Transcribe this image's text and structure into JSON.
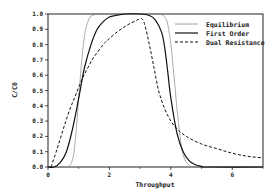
{
  "chart_data": {
    "type": "line",
    "title": "",
    "xlabel": "Throughput",
    "ylabel": "C/C0",
    "xlim": [
      0,
      7
    ],
    "ylim": [
      0,
      1.0
    ],
    "xticks": [
      0,
      2,
      4,
      6
    ],
    "xminor_ticks": [
      1,
      3,
      5,
      7
    ],
    "yticks": [
      0.0,
      0.1,
      0.2,
      0.3,
      0.4,
      0.5,
      0.6,
      0.7,
      0.8,
      0.9,
      1.0
    ],
    "ytick_labels": [
      "0.0",
      "0.1",
      "0.2",
      "0.3",
      "0.4",
      "0.5",
      "0.6",
      "0.7",
      "0.8",
      "0.9",
      "1.0"
    ],
    "grid": false,
    "legend_position": "upper right",
    "series": [
      {
        "name": "Equilibrium",
        "style": "thin-solid",
        "color": "#888888",
        "x": [
          0,
          0.6,
          0.8,
          0.9,
          1.0,
          1.1,
          1.2,
          1.3,
          1.4,
          1.6,
          1.8,
          2.0,
          3.0,
          3.6,
          3.8,
          3.9,
          4.0,
          4.1,
          4.2,
          4.3,
          4.4,
          4.6,
          5.0,
          7.0
        ],
        "y": [
          0,
          0,
          0.05,
          0.2,
          0.45,
          0.7,
          0.87,
          0.95,
          0.985,
          1.0,
          1.0,
          1.0,
          1.0,
          1.0,
          0.98,
          0.93,
          0.8,
          0.6,
          0.38,
          0.2,
          0.08,
          0.01,
          0,
          0
        ]
      },
      {
        "name": "First Order",
        "style": "solid",
        "color": "#111111",
        "x": [
          0,
          0.2,
          0.4,
          0.6,
          0.8,
          1.0,
          1.1,
          1.2,
          1.4,
          1.6,
          1.8,
          2.0,
          2.2,
          2.5,
          3.0,
          3.3,
          3.5,
          3.7,
          3.8,
          3.9,
          4.0,
          4.2,
          4.4,
          4.6,
          4.8,
          5.0,
          5.2,
          7.0
        ],
        "y": [
          0,
          0.0,
          0.03,
          0.1,
          0.25,
          0.45,
          0.56,
          0.66,
          0.8,
          0.9,
          0.95,
          0.98,
          0.99,
          1.0,
          1.0,
          0.99,
          0.96,
          0.88,
          0.78,
          0.62,
          0.45,
          0.22,
          0.1,
          0.04,
          0.015,
          0.005,
          0,
          0
        ]
      },
      {
        "name": "Dual Resistance",
        "style": "dashed",
        "color": "#111111",
        "x": [
          0.1,
          0.3,
          0.5,
          0.7,
          0.9,
          1.1,
          1.3,
          1.5,
          1.8,
          2.0,
          2.3,
          2.6,
          2.9,
          3.05,
          3.15,
          3.3,
          3.45,
          3.6,
          3.8,
          4.0,
          4.2,
          4.5,
          5.0,
          5.5,
          6.0,
          6.5,
          7.0
        ],
        "y": [
          0.0,
          0.12,
          0.25,
          0.37,
          0.47,
          0.57,
          0.65,
          0.72,
          0.8,
          0.84,
          0.89,
          0.93,
          0.96,
          0.97,
          0.93,
          0.8,
          0.65,
          0.5,
          0.38,
          0.3,
          0.25,
          0.2,
          0.15,
          0.12,
          0.09,
          0.07,
          0.06
        ]
      }
    ]
  },
  "legend": {
    "items": [
      {
        "label": "Equilibrium"
      },
      {
        "label": "First Order"
      },
      {
        "label": "Dual Resistance"
      }
    ]
  },
  "axes": {
    "xlabel": "Throughput",
    "ylabel": "C/C0"
  }
}
